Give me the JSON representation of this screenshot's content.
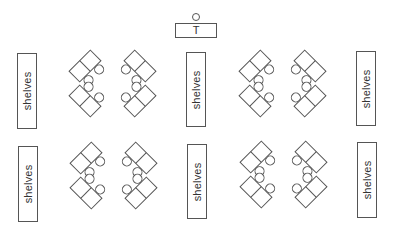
{
  "diagram": {
    "stroke_color": "#555555",
    "text_color": "#333333",
    "background": "#ffffff"
  },
  "teacher": {
    "label": "T",
    "desk": {
      "x": 175,
      "y": 23,
      "w": 42,
      "h": 15
    },
    "chair": {
      "cx": 196,
      "cy": 17,
      "r": 4
    }
  },
  "shelves": [
    {
      "id": "shelf-top-left",
      "label": "shelves",
      "x": 17,
      "y": 53,
      "w": 20,
      "h": 76
    },
    {
      "id": "shelf-top-middle",
      "label": "shelves",
      "x": 186,
      "y": 52,
      "w": 20,
      "h": 75
    },
    {
      "id": "shelf-top-right",
      "label": "shelves",
      "x": 356,
      "y": 51,
      "w": 20,
      "h": 75
    },
    {
      "id": "shelf-bottom-left",
      "label": "shelves",
      "x": 18,
      "y": 146,
      "w": 20,
      "h": 76
    },
    {
      "id": "shelf-bottom-middle",
      "label": "shelves",
      "x": 187,
      "y": 144,
      "w": 20,
      "h": 75
    },
    {
      "id": "shelf-bottom-right",
      "label": "shelves",
      "x": 357,
      "y": 142,
      "w": 20,
      "h": 76
    }
  ],
  "desk_groups": [
    {
      "id": "group-top-left",
      "left_x": 85,
      "right_x": 140,
      "upper_y": 66,
      "lower_y": 101
    },
    {
      "id": "group-top-right",
      "left_x": 255,
      "right_x": 310,
      "upper_y": 66,
      "lower_y": 101
    },
    {
      "id": "group-bottom-left",
      "left_x": 86,
      "right_x": 141,
      "upper_y": 158,
      "lower_y": 193
    },
    {
      "id": "group-bottom-right",
      "left_x": 256,
      "right_x": 311,
      "upper_y": 157,
      "lower_y": 192
    }
  ],
  "desk_pair": {
    "length": 30,
    "width": 15,
    "chair_r": 4.5
  }
}
